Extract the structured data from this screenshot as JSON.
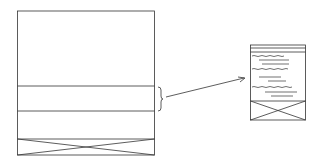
{
  "diagram": {
    "colors": {
      "stroke": "#333333",
      "background": "#ffffff"
    },
    "left_panel": {
      "sections": [
        "header-area",
        "highlighted-band",
        "empty-band",
        "image-placeholder"
      ]
    },
    "right_panel": {
      "sections": [
        "header-rule",
        "text-lines",
        "image-placeholder"
      ]
    },
    "connector": {
      "type": "brace-with-arrow"
    }
  }
}
